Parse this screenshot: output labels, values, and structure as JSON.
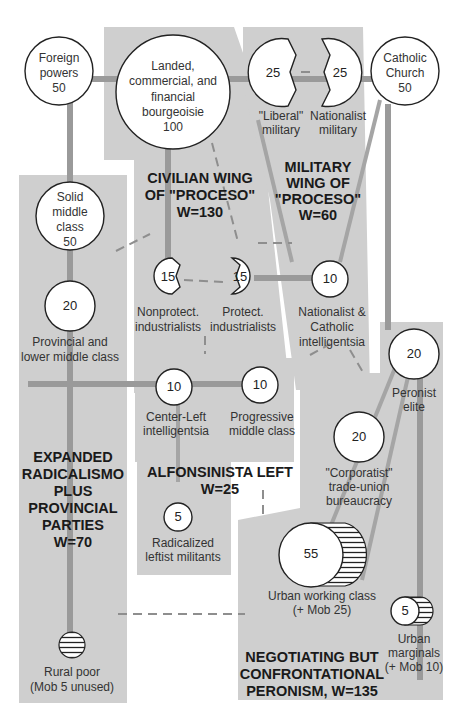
{
  "diagram": {
    "groups": [
      {
        "id": "civilian",
        "title": [
          "CIVILIAN WING",
          "OF \"PROCESO\"",
          "W=130"
        ]
      },
      {
        "id": "military",
        "title": [
          "MILITARY",
          "WING OF",
          "\"PROCESO\"",
          "W=60"
        ]
      },
      {
        "id": "radicalismo",
        "title": [
          "EXPANDED",
          "RADICALISMO",
          "PLUS",
          "PROVINCIAL",
          "PARTIES",
          "W=70"
        ]
      },
      {
        "id": "alfonsinista",
        "title": [
          "ALFONSINISTA LEFT",
          "W=25"
        ]
      },
      {
        "id": "peronism",
        "title": [
          "NEGOTIATING BUT",
          "CONFRONTATIONAL",
          "PERONISM, W=135"
        ]
      }
    ],
    "nodes": {
      "foreign": {
        "label": [
          "Foreign",
          "powers",
          "50"
        ]
      },
      "bourgeoisie": {
        "label": [
          "Landed,",
          "commercial, and",
          "financial",
          "bourgeoisie",
          "100"
        ]
      },
      "liberal_military": {
        "value": "25",
        "label": [
          "\"Liberal\"",
          "military"
        ]
      },
      "nationalist_military": {
        "value": "25",
        "label": [
          "Nationalist",
          "military"
        ]
      },
      "church": {
        "label": [
          "Catholic",
          "Church",
          "50"
        ]
      },
      "solid_middle": {
        "label": [
          "Solid",
          "middle",
          "class",
          "50"
        ]
      },
      "provincial_middle": {
        "value": "20",
        "label": [
          "Provincial and",
          "lower middle class"
        ]
      },
      "nonprotect": {
        "value": "15",
        "label": [
          "Nonprotect.",
          "industrialists"
        ]
      },
      "protect": {
        "value": "15",
        "label": [
          "Protect.",
          "industrialists"
        ]
      },
      "nat_cath_intel": {
        "value": "10",
        "label": [
          "Nationalist &",
          "Catholic",
          "intelligentsia"
        ]
      },
      "center_left": {
        "value": "10",
        "label": [
          "Center-Left",
          "intelligentsia"
        ]
      },
      "progressive_middle": {
        "value": "10",
        "label": [
          "Progressive",
          "middle class"
        ]
      },
      "radical_left": {
        "value": "5",
        "label": [
          "Radicalized",
          "leftist militants"
        ]
      },
      "peronist_elite": {
        "value": "20",
        "label": [
          "Peronist",
          "elite"
        ]
      },
      "corporatist": {
        "value": "20",
        "label": [
          "\"Corporatist\"",
          "trade-union",
          "bureaucracy"
        ]
      },
      "urban_working": {
        "value": "55",
        "label": [
          "Urban working class",
          "(+ Mob 25)"
        ]
      },
      "urban_marginals": {
        "value": "5",
        "label": [
          "Urban",
          "marginals",
          "(+ Mob 10)"
        ]
      },
      "rural_poor": {
        "label": [
          "Rural poor",
          "(Mob 5 unused)"
        ]
      }
    },
    "colors": {
      "panel": "#cfcfcf",
      "link": "#9a9a9a",
      "node_stroke": "#222222",
      "background": "#ffffff"
    }
  }
}
